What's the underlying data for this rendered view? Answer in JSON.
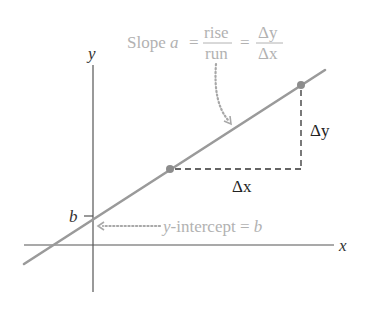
{
  "diagram": {
    "axes": {
      "x_label": "x",
      "y_label": "y"
    },
    "slope_label": {
      "prefix": "Slope ",
      "variable": "a",
      "equals1": " = ",
      "frac1_num": "rise",
      "frac1_den": "run",
      "equals2": " = ",
      "frac2_num": "Δy",
      "frac2_den": "Δx"
    },
    "delta_x_label": "Δx",
    "delta_y_label": "Δy",
    "intercept_tick_label": "b",
    "intercept_label": {
      "var": "y",
      "text": "-intercept = ",
      "value": "b"
    },
    "points": [
      {
        "name": "point-1",
        "x": 170,
        "y": 169
      },
      {
        "name": "point-2",
        "x": 301,
        "y": 85
      }
    ],
    "colors": {
      "line": "#9a9a9a",
      "annotation": "#b2b2b2",
      "axis": "#555555",
      "text": "#222222"
    }
  }
}
